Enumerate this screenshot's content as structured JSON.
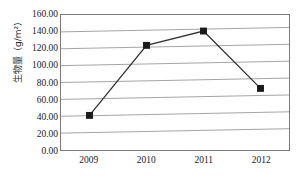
{
  "chart_data": {
    "type": "line",
    "title": "",
    "subtitle": "",
    "xlabel": "",
    "ylabel": "生物量（g/m²）",
    "categories": [
      "2009",
      "2010",
      "2011",
      "2012"
    ],
    "values": [
      41.0,
      124.0,
      141.0,
      73.0
    ],
    "series": [
      {
        "name": "生物量",
        "values": [
          41.0,
          124.0,
          141.0,
          73.0
        ],
        "line_color": "#333333",
        "marker": "square",
        "marker_color": "#1a1a1a"
      }
    ],
    "ylim": [
      0,
      160
    ],
    "yticks": [
      0.0,
      20.0,
      40.0,
      60.0,
      80.0,
      100.0,
      120.0,
      140.0,
      160.0
    ],
    "ytick_labels": [
      "0.00",
      "20.00",
      "40.00",
      "60.00",
      "80.00",
      "100.00",
      "120.00",
      "140.00",
      "160.00"
    ],
    "xtick_labels": [
      "2009",
      "2010",
      "2011",
      "2012"
    ],
    "grid": "horizontal",
    "grid_color": "#9a9a9a",
    "legend": "none",
    "legend_position": "none",
    "plot_border_color": "#7a7a7a",
    "background_color": "#ffffff"
  }
}
